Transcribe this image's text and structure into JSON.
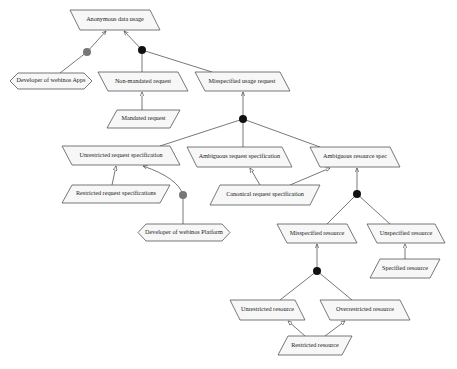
{
  "diagram": {
    "type": "goal-obstacle model",
    "nodes": [
      {
        "id": "anonymous",
        "label": "Anonymous data usage",
        "shape": "parallelogram",
        "x": 70,
        "y": 10,
        "w": 90,
        "h": 20
      },
      {
        "id": "dev_apps",
        "label": "Developer of webinos Apps",
        "shape": "hexagon",
        "x": 10,
        "y": 73,
        "w": 82,
        "h": 16
      },
      {
        "id": "non_mandated",
        "label": "Non-mandated request",
        "shape": "parallelogram",
        "x": 98,
        "y": 72,
        "w": 90,
        "h": 19
      },
      {
        "id": "misspec_usage",
        "label": "Misspecified usage request",
        "shape": "parallelogram",
        "x": 195,
        "y": 72,
        "w": 95,
        "h": 19
      },
      {
        "id": "mandated",
        "label": "Mandated request",
        "shape": "parallelogram",
        "x": 107,
        "y": 110,
        "w": 73,
        "h": 18
      },
      {
        "id": "unrestricted_spec",
        "label": "Unrestricted request specification",
        "shape": "parallelogram",
        "x": 62,
        "y": 146,
        "w": 118,
        "h": 19
      },
      {
        "id": "ambiguous_spec",
        "label": "Ambiguous request specification",
        "shape": "parallelogram",
        "x": 187,
        "y": 147,
        "w": 105,
        "h": 20
      },
      {
        "id": "ambiguous_res",
        "label": "Ambiguous resource spec",
        "shape": "parallelogram",
        "x": 310,
        "y": 147,
        "w": 90,
        "h": 20
      },
      {
        "id": "restricted_spec",
        "label": "Restricted request specifications",
        "shape": "parallelogram",
        "x": 62,
        "y": 185,
        "w": 108,
        "h": 18
      },
      {
        "id": "canonical_spec",
        "label": "Canonical request specification",
        "shape": "parallelogram",
        "x": 210,
        "y": 185,
        "w": 110,
        "h": 20
      },
      {
        "id": "dev_platform",
        "label": "Developer of webinos Platform",
        "shape": "hexagon",
        "x": 138,
        "y": 224,
        "w": 92,
        "h": 17
      },
      {
        "id": "misspec_res",
        "label": "Misspecified resource",
        "shape": "parallelogram",
        "x": 277,
        "y": 224,
        "w": 80,
        "h": 19
      },
      {
        "id": "unspec_res",
        "label": "Unspecified resource",
        "shape": "parallelogram",
        "x": 367,
        "y": 224,
        "w": 78,
        "h": 19
      },
      {
        "id": "spec_res",
        "label": "Specified resource",
        "shape": "parallelogram",
        "x": 370,
        "y": 259,
        "w": 70,
        "h": 19
      },
      {
        "id": "unrestricted_res",
        "label": "Unrestricted resource",
        "shape": "parallelogram",
        "x": 230,
        "y": 300,
        "w": 75,
        "h": 20
      },
      {
        "id": "overrestricted_res",
        "label": "Overrestricted resource",
        "shape": "parallelogram",
        "x": 320,
        "y": 300,
        "w": 90,
        "h": 20
      },
      {
        "id": "restricted_res",
        "label": "Restricted resource",
        "shape": "parallelogram",
        "x": 278,
        "y": 336,
        "w": 74,
        "h": 19
      }
    ],
    "junctions": [
      {
        "id": "j_dev_apps",
        "x": 87,
        "y": 52,
        "color": "#777777"
      },
      {
        "id": "j_anonymous",
        "x": 142,
        "y": 50,
        "color": "#111111"
      },
      {
        "id": "j_misspec_usage",
        "x": 243,
        "y": 119,
        "color": "#111111"
      },
      {
        "id": "j_dev_platform",
        "x": 183,
        "y": 195,
        "color": "#777777"
      },
      {
        "id": "j_ambiguous_res",
        "x": 357,
        "y": 194,
        "color": "#111111"
      },
      {
        "id": "j_misspec_res",
        "x": 317,
        "y": 271,
        "color": "#111111"
      }
    ],
    "colors": {
      "shape_fill": "#f7f7f7",
      "stroke": "#555555",
      "and_junction": "#111111",
      "responsibility_junction": "#777777"
    }
  }
}
